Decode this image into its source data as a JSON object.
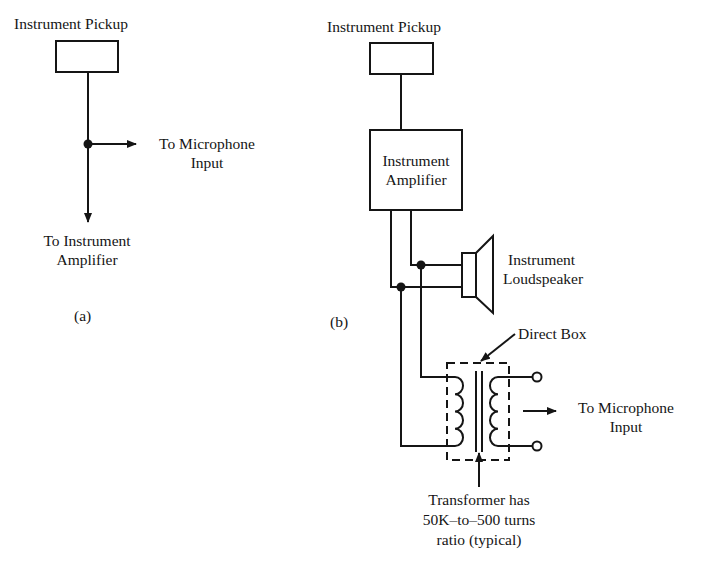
{
  "panel_a": {
    "caption": "(a)",
    "pickup_label": "Instrument Pickup",
    "mic_output": [
      "To Microphone",
      "Input"
    ],
    "amp_output": [
      "To Instrument",
      "Amplifier"
    ]
  },
  "panel_b": {
    "caption": "(b)",
    "pickup_label": "Instrument Pickup",
    "amplifier_label": [
      "Instrument",
      "Amplifier"
    ],
    "loudspeaker_label": [
      "Instrument",
      "Loudspeaker"
    ],
    "direct_box_label": "Direct Box",
    "mic_output": [
      "To Microphone",
      "Input"
    ],
    "transformer_note": [
      "Transformer has",
      "50K–to–500 turns",
      "ratio (typical)"
    ]
  },
  "colors": {
    "ink": "#151515",
    "background": "#ffffff"
  }
}
